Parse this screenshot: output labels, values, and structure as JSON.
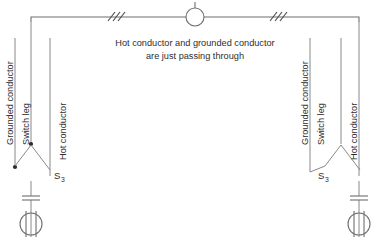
{
  "diagram": {
    "background_color": "#ffffff",
    "line_color": "#6e6e6e",
    "text_color": "#2e2e2e",
    "note": {
      "line1": "Hot conductor and grounded conductor",
      "line2": "are just passing through"
    },
    "center_box": {
      "name": "junction-box",
      "shape": "circle"
    },
    "cable_marks": {
      "left_count": "3",
      "right_count": "3",
      "meaning": "three conductors"
    },
    "left_branch": {
      "labels": {
        "grounded_conductor": "Grounded conductor",
        "switch_leg": "Switch leg",
        "hot_conductor": "Hot conductor"
      },
      "switch_label": "S",
      "switch_subscript": "3",
      "fixture": "lamp-fixture"
    },
    "right_branch": {
      "labels": {
        "grounded_conductor": "Grounded conductor",
        "switch_leg": "Switch leg",
        "hot_conductor": "Hot conductor"
      },
      "switch_label": "S",
      "switch_subscript": "3",
      "fixture": "lamp-fixture"
    }
  }
}
